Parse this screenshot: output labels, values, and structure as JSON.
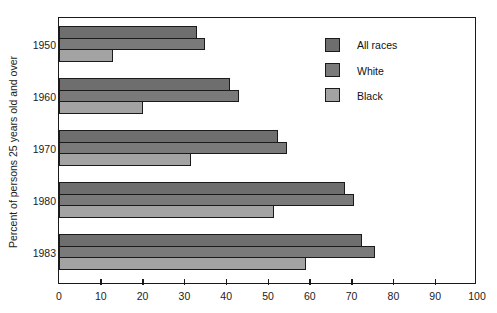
{
  "chart_data": {
    "type": "bar",
    "orientation": "horizontal",
    "title": "",
    "xlabel": "",
    "ylabel": "Percent of persons 25 years old and over",
    "categories": [
      "1950",
      "1960",
      "1970",
      "1980",
      "1983"
    ],
    "series": [
      {
        "name": "All races",
        "color": "#6e6e6e",
        "values": [
          33,
          41,
          52.5,
          68.5,
          72.5
        ]
      },
      {
        "name": "White",
        "color": "#7a7a7a",
        "values": [
          35,
          43,
          54.5,
          70.5,
          75.5
        ]
      },
      {
        "name": "Black",
        "color": "#a3a3a3",
        "values": [
          13,
          20,
          31.5,
          51.5,
          59
        ]
      }
    ],
    "xlim": [
      0,
      100
    ],
    "xticks": [
      0,
      10,
      20,
      30,
      40,
      50,
      60,
      70,
      80,
      90,
      100
    ],
    "grid": false,
    "legend_position": "upper right inside"
  },
  "axis": {
    "y_title": "Percent of persons 25 years old and over",
    "categories": [
      "1950",
      "1960",
      "1970",
      "1980",
      "1983"
    ],
    "x_ticks": [
      "0",
      "10",
      "20",
      "30",
      "40",
      "50",
      "60",
      "70",
      "80",
      "90",
      "100"
    ]
  },
  "legend": {
    "items": [
      {
        "label": "All races",
        "color": "#6e6e6e"
      },
      {
        "label": "White",
        "color": "#7a7a7a"
      },
      {
        "label": "Black",
        "color": "#a3a3a3"
      }
    ]
  }
}
